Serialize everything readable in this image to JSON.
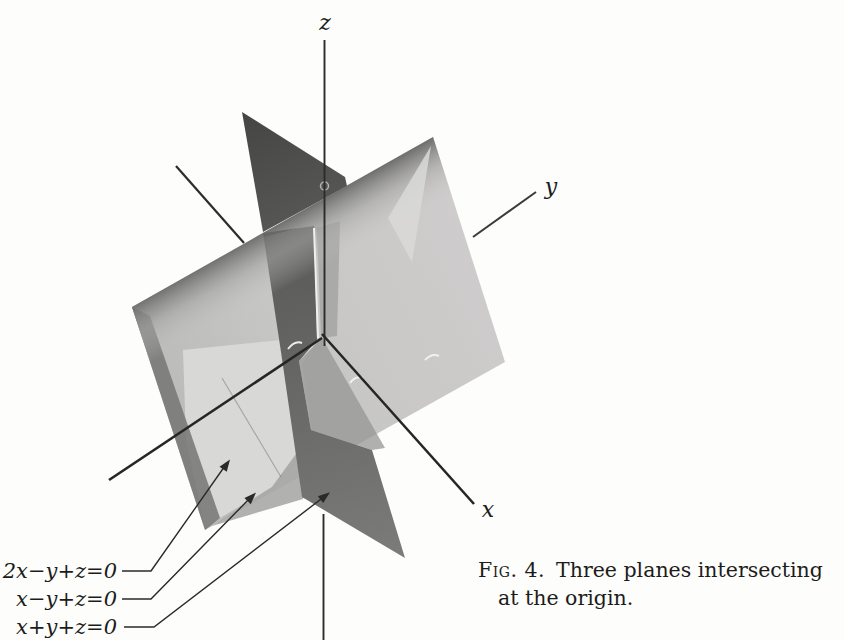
{
  "figure": {
    "caption": {
      "tag": "Fig. 4.",
      "line1": "Three planes intersecting",
      "line2": "at the origin."
    },
    "axis_labels": {
      "x": "x",
      "y": "y",
      "z": "z"
    },
    "equations": [
      {
        "id": "plane-1",
        "label": "2x−y+z=0"
      },
      {
        "id": "plane-2",
        "label": "x−y+z=0"
      },
      {
        "id": "plane-3",
        "label": "x+y+z=0"
      }
    ],
    "colors": {
      "paper": "#fdfdfb",
      "plane_light": "#c6c6c4",
      "plane_bright": "#d8d8d6",
      "plane_dark": "#5d5d5b",
      "axis": "#2c2c2a"
    }
  }
}
